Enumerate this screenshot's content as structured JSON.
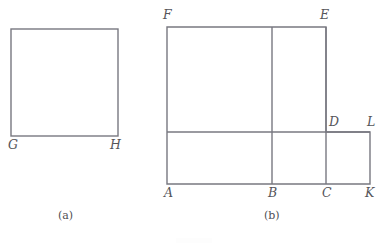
{
  "page": {
    "width": 388,
    "height": 243,
    "background": "#ffffff",
    "stroke_color": "#787880",
    "label_color": "#55555a",
    "stroke_width": 1.4
  },
  "figure_a": {
    "caption": "(a)",
    "caption_pos": {
      "x": 58,
      "y": 210
    },
    "shape": "square",
    "rect": {
      "x": 11,
      "y": 29,
      "width": 107,
      "height": 107
    },
    "vertices": [
      {
        "label": "G",
        "x": 11,
        "y": 136,
        "label_x": 8,
        "label_y": 139
      },
      {
        "label": "H",
        "x": 118,
        "y": 136,
        "label_x": 110,
        "label_y": 139
      }
    ]
  },
  "figure_b": {
    "caption": "(b)",
    "caption_pos": {
      "x": 264,
      "y": 210
    },
    "shape": "compound-rectilinear-polygon",
    "outline_points": "167,27 326,27 326,132 370,132 370,184 167,184",
    "interior_lines": [
      {
        "name": "horizontal-ADL",
        "x1": 167,
        "y1": 132,
        "x2": 370,
        "y2": 132
      },
      {
        "name": "vertical-BE",
        "x1": 272,
        "y1": 27,
        "x2": 272,
        "y2": 184
      },
      {
        "name": "vertical-CDE",
        "x1": 326,
        "y1": 27,
        "x2": 326,
        "y2": 184
      }
    ],
    "vertices": [
      {
        "label": "F",
        "x": 167,
        "y": 27,
        "label_x": 163,
        "label_y": 9
      },
      {
        "label": "E",
        "x": 326,
        "y": 27,
        "label_x": 320,
        "label_y": 9
      },
      {
        "label": "D",
        "x": 326,
        "y": 132,
        "label_x": 329,
        "label_y": 116
      },
      {
        "label": "L",
        "x": 370,
        "y": 132,
        "label_x": 367,
        "label_y": 116
      },
      {
        "label": "A",
        "x": 167,
        "y": 184,
        "label_x": 164,
        "label_y": 187
      },
      {
        "label": "B",
        "x": 272,
        "y": 184,
        "label_x": 268,
        "label_y": 187
      },
      {
        "label": "C",
        "x": 326,
        "y": 184,
        "label_x": 322,
        "label_y": 187
      },
      {
        "label": "K",
        "x": 370,
        "y": 184,
        "label_x": 365,
        "label_y": 187
      }
    ]
  }
}
